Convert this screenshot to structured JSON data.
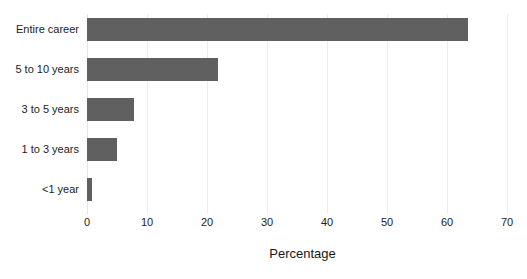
{
  "chart_data": {
    "type": "bar",
    "orientation": "horizontal",
    "title": "",
    "subtitle": "",
    "xlabel": "Percentage",
    "ylabel": "",
    "categories": [
      "Entire career",
      "5 to 10 years",
      "3 to 5 years",
      "1 to 3 years",
      "<1 year"
    ],
    "values": [
      63.5,
      21.8,
      7.8,
      5.0,
      0.8
    ],
    "series": [
      {
        "name": "Percentage",
        "values": [
          63.5,
          21.8,
          7.8,
          5.0,
          0.8
        ]
      }
    ],
    "xlim": [
      0,
      70
    ],
    "xticks": [
      0,
      10,
      20,
      30,
      40,
      50,
      60,
      70
    ],
    "xtick_labels": [
      "0",
      "10",
      "20",
      "30",
      "40",
      "50",
      "60",
      "70"
    ],
    "grid": "vertical-light",
    "legend": "none",
    "bar_color": "#606060",
    "background_color": "#ffffff",
    "gridline_color": "#ededed"
  }
}
